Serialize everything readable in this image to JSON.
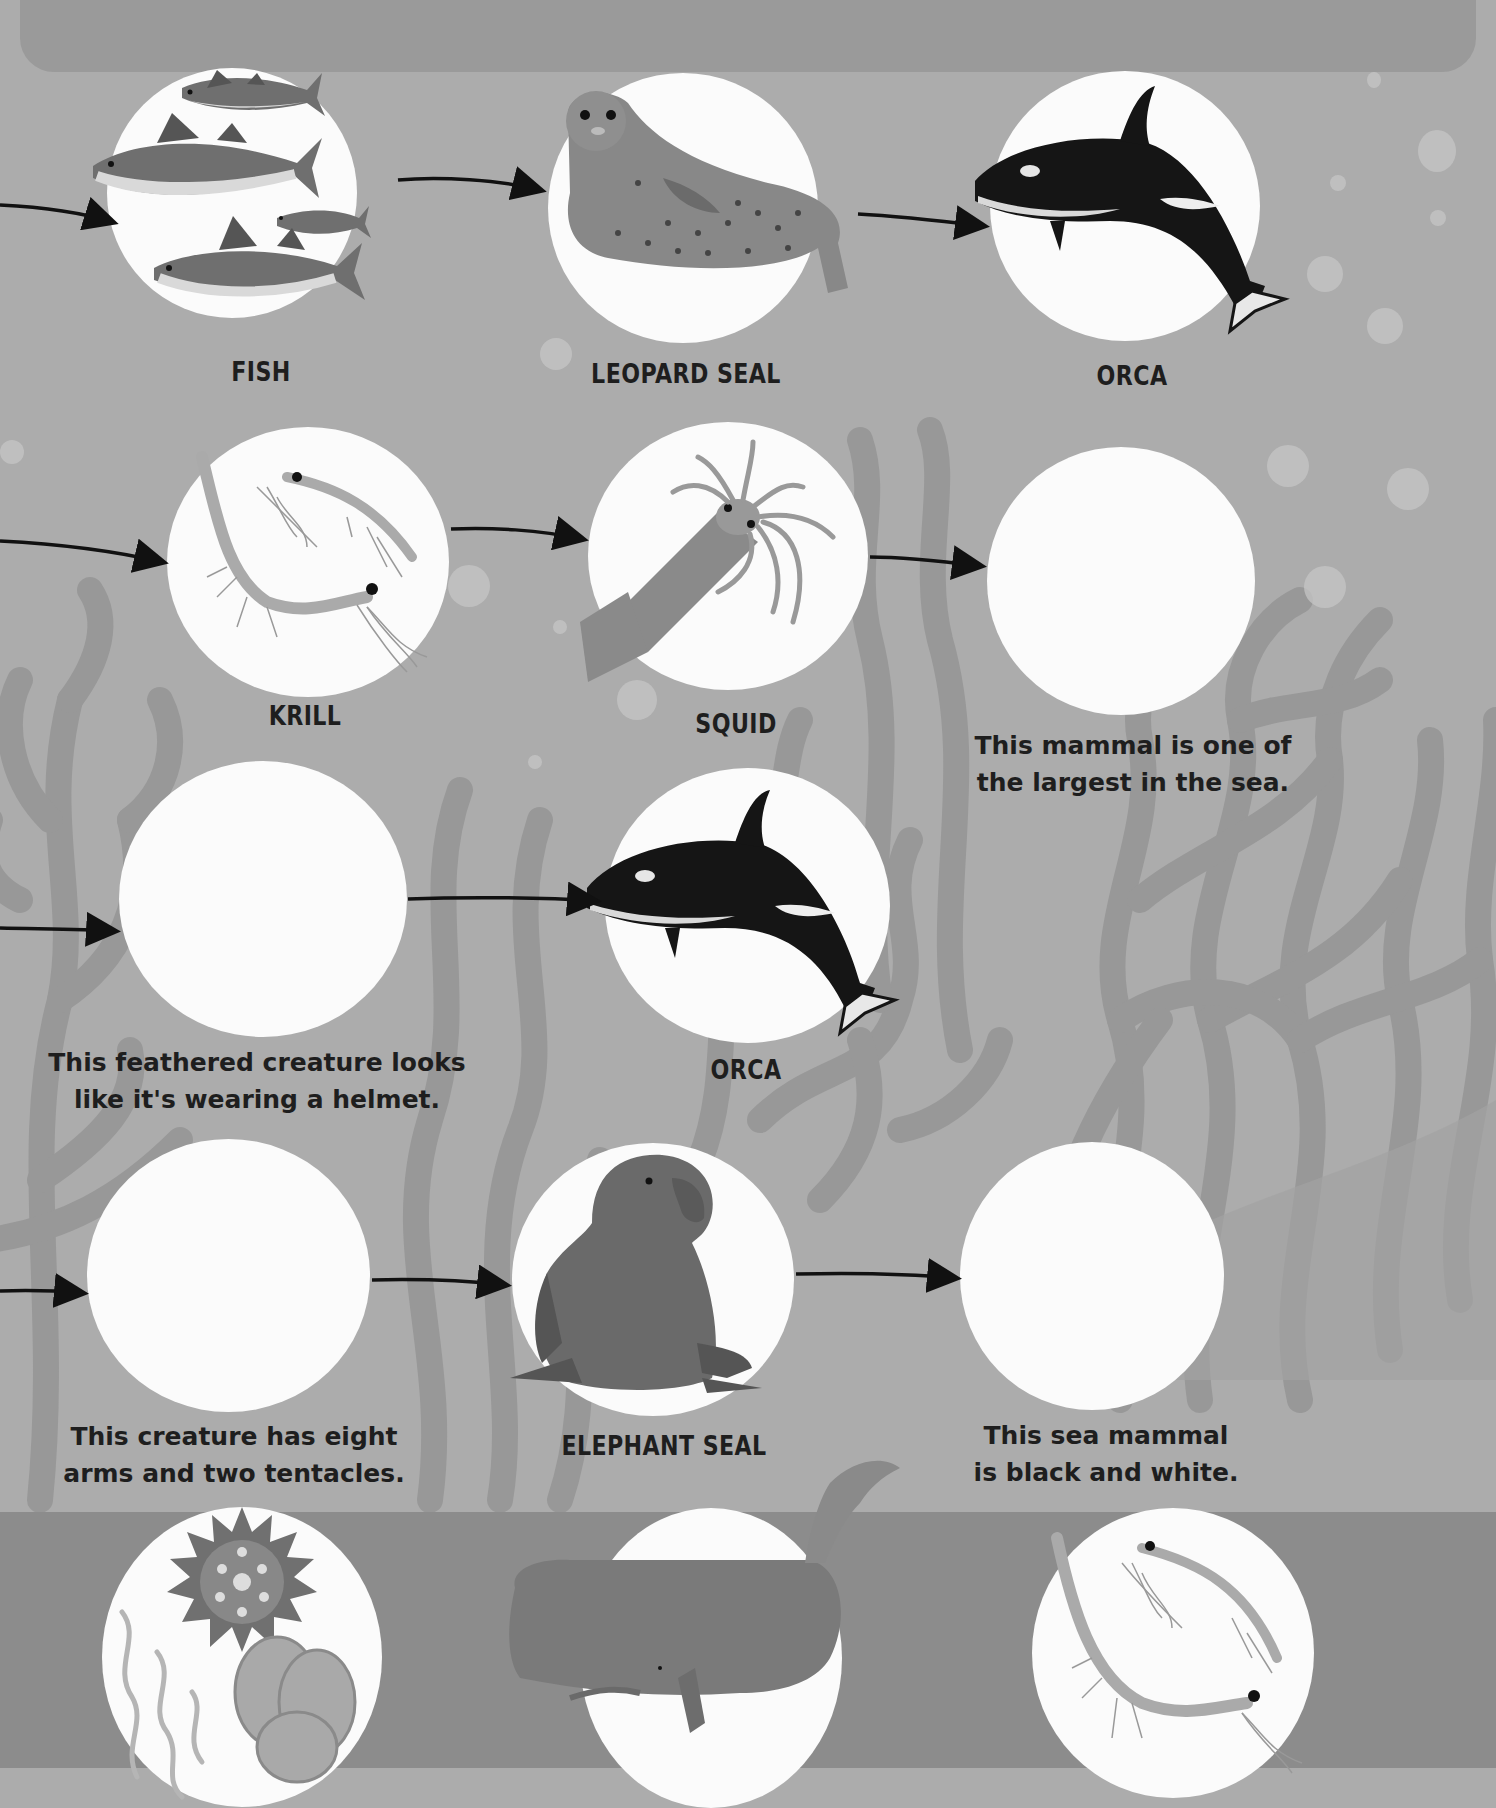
{
  "page": {
    "colors": {
      "background": "#acacac",
      "banner": "#9a9a9a",
      "bottom_band": "#8c8c8c",
      "seaweed": "#989898",
      "circle": "#fbfbfb",
      "text": "#1e1e1e"
    }
  },
  "food_chains": [
    {
      "row": 1,
      "nodes": [
        {
          "type": "animal",
          "label": "FISH",
          "icon": "fish-school-icon"
        },
        {
          "type": "animal",
          "label": "LEOPARD SEAL",
          "icon": "leopard-seal-icon"
        },
        {
          "type": "animal",
          "label": "ORCA",
          "icon": "orca-icon"
        }
      ]
    },
    {
      "row": 2,
      "nodes": [
        {
          "type": "animal",
          "label": "KRILL",
          "icon": "krill-icon"
        },
        {
          "type": "animal",
          "label": "SQUID",
          "icon": "squid-icon"
        },
        {
          "type": "blank",
          "clue": [
            "This mammal is one of",
            "the largest in the sea."
          ]
        }
      ]
    },
    {
      "row": 3,
      "nodes": [
        {
          "type": "blank",
          "clue": [
            "This feathered creature looks",
            "like it's wearing a helmet."
          ]
        },
        {
          "type": "animal",
          "label": "ORCA",
          "icon": "orca-icon"
        }
      ]
    },
    {
      "row": 4,
      "nodes": [
        {
          "type": "blank",
          "clue": [
            "This creature has eight",
            "arms and two tentacles."
          ]
        },
        {
          "type": "animal",
          "label": "ELEPHANT SEAL",
          "icon": "elephant-seal-icon"
        },
        {
          "type": "blank",
          "clue": [
            "This sea mammal",
            "is black and white."
          ]
        }
      ]
    }
  ],
  "answer_bank": [
    {
      "icon": "plankton-icon"
    },
    {
      "icon": "sperm-whale-icon"
    },
    {
      "icon": "krill-icon"
    }
  ]
}
